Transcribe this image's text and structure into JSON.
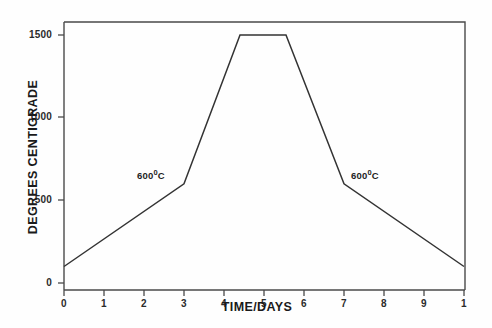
{
  "chart_data": {
    "type": "line",
    "title": "",
    "subtitle": "",
    "xlabel": "TIME/DAYS",
    "ylabel": "DEGREES CENTIGRADE",
    "xlim": [
      0,
      10
    ],
    "ylim": [
      0,
      1620
    ],
    "grid": false,
    "legend": null,
    "x_ticks": [
      0,
      1,
      2,
      3,
      4,
      5,
      6,
      7,
      8,
      9,
      10
    ],
    "x_tick_labels": [
      "0",
      "1",
      "2",
      "3",
      "4",
      "5",
      "6",
      "7",
      "8",
      "9",
      "1"
    ],
    "y_ticks": [
      0,
      500,
      1000,
      1500
    ],
    "y_tick_labels": [
      "0",
      "500",
      "1000",
      "1500"
    ],
    "series": [
      {
        "name": "Firing schedule",
        "color": "#333333",
        "x": [
          0,
          3,
          4.4,
          5.55,
          7,
          10
        ],
        "y": [
          100,
          600,
          1500,
          1500,
          600,
          100
        ]
      }
    ],
    "annotations": [
      {
        "text": "600",
        "degree": "0",
        "unit": "C",
        "x": 2.0,
        "y": 740
      },
      {
        "text": "600",
        "degree": "0",
        "unit": "C",
        "x": 7.2,
        "y": 740
      }
    ]
  },
  "axes": {
    "y_title": "DEGREES CENTIGRADE",
    "x_title": "TIME/DAYS",
    "y_labels": [
      "1500",
      "1000",
      "500",
      "0"
    ],
    "x_labels": [
      "0",
      "1",
      "2",
      "3",
      "4",
      "5",
      "6",
      "7",
      "8",
      "9",
      "1"
    ]
  },
  "annotations": {
    "left_label_value": "600",
    "left_label_degree": "0",
    "left_label_unit": "C",
    "right_label_value": "600",
    "right_label_degree": "0",
    "right_label_unit": "C"
  },
  "colors": {
    "line": "#333333",
    "axis": "#444444",
    "text": "#1a1a1a",
    "background": "#ffffff"
  }
}
